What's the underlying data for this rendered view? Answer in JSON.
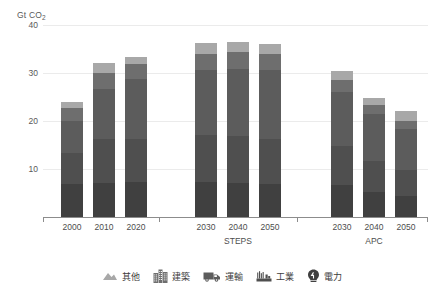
{
  "chart_data": {
    "type": "bar",
    "subtype": "stacked-bar",
    "title": "",
    "xlabel": "",
    "ylabel": "Gt CO2",
    "ylabel_display": "Gt CO",
    "ylabel_subscript": "2",
    "ylim": [
      0,
      40
    ],
    "yticks": [
      10,
      20,
      30,
      40
    ],
    "grid": true,
    "legend_position": "bottom",
    "categories": [
      "2000",
      "2010",
      "2020",
      "2030",
      "2040",
      "2050",
      "2030",
      "2040",
      "2050"
    ],
    "group_labels": [
      "",
      "STEPS",
      "APC"
    ],
    "groups": [
      {
        "name": "",
        "categories": [
          "2000",
          "2010",
          "2020"
        ]
      },
      {
        "name": "STEPS",
        "categories": [
          "2030",
          "2040",
          "2050"
        ]
      },
      {
        "name": "APC",
        "categories": [
          "2030",
          "2040",
          "2050"
        ]
      }
    ],
    "series": [
      {
        "name": "電力",
        "name_en": "Power",
        "color": "#404040",
        "values": [
          6.8,
          7.0,
          7.2,
          7.3,
          7.1,
          6.9,
          6.6,
          5.2,
          4.3
        ]
      },
      {
        "name": "工業",
        "name_en": "Industry",
        "color": "#4f4f4f",
        "values": [
          6.6,
          9.2,
          9.0,
          9.8,
          9.8,
          9.4,
          8.2,
          6.4,
          5.6
        ]
      },
      {
        "name": "運輸",
        "name_en": "Transport",
        "color": "#5c5c5c",
        "values": [
          6.7,
          10.5,
          12.5,
          13.6,
          14.0,
          14.4,
          11.3,
          9.9,
          8.5
        ]
      },
      {
        "name": "建築",
        "name_en": "Buildings",
        "color": "#6e6e6e",
        "values": [
          2.7,
          3.3,
          3.1,
          3.3,
          3.4,
          3.3,
          2.4,
          1.8,
          1.6
        ]
      },
      {
        "name": "其他",
        "name_en": "Other",
        "color": "#a8a8a8",
        "values": [
          1.2,
          2.0,
          1.5,
          2.2,
          2.1,
          2.1,
          2.0,
          1.5,
          2.2
        ]
      }
    ],
    "totals": [
      24.0,
      32.0,
      33.3,
      36.2,
      36.4,
      36.1,
      30.5,
      24.8,
      22.2
    ]
  },
  "legend": {
    "items": [
      {
        "label": "其他",
        "icon": "mountain-icon",
        "color": "#a8a8a8"
      },
      {
        "label": "建築",
        "icon": "building-icon",
        "color": "#6e6e6e"
      },
      {
        "label": "運輸",
        "icon": "truck-icon",
        "color": "#5c5c5c"
      },
      {
        "label": "工業",
        "icon": "factory-icon",
        "color": "#4f4f4f"
      },
      {
        "label": "電力",
        "icon": "lightbulb-icon",
        "color": "#404040"
      }
    ]
  }
}
